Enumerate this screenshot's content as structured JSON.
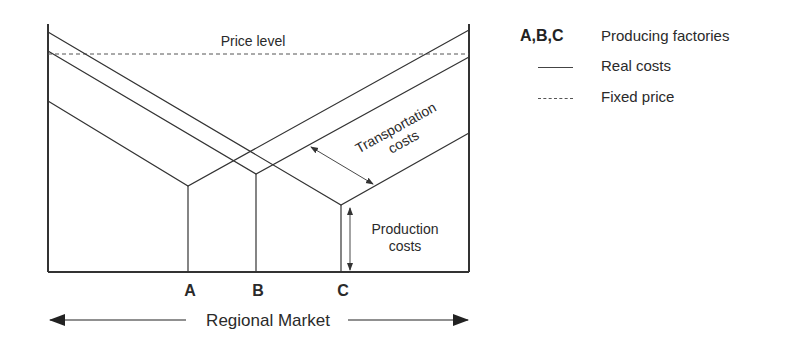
{
  "diagram": {
    "price_level_label": "Price level",
    "transport_label_line1": "Transportation",
    "transport_label_line2": "costs",
    "production_label_line1": "Production",
    "production_label_line2": "costs",
    "factory_labels": [
      "A",
      "B",
      "C"
    ],
    "x_axis_label": "Regional Market"
  },
  "legend": {
    "items": [
      {
        "key": "A,B,C",
        "label": "Producing factories"
      },
      {
        "key": "solid-line",
        "label": "Real costs"
      },
      {
        "key": "dashed-line",
        "label": "Fixed price"
      }
    ]
  },
  "colors": {
    "line": "#333333",
    "text": "#2a2a2a",
    "background": "#ffffff"
  }
}
